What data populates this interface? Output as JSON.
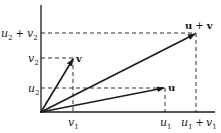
{
  "diagram": {
    "vectors": [
      {
        "name": "u",
        "label": "u",
        "x": 165,
        "y": 88
      },
      {
        "name": "v",
        "label": "v",
        "x": 74,
        "y": 58
      },
      {
        "name": "u+v",
        "label_a": "u",
        "label_plus": "+",
        "label_b": "v",
        "x": 196,
        "y": 33
      }
    ],
    "y_axis_labels": {
      "u2_plus_v2": {
        "a": "u",
        "a_sub": "2",
        "plus": "+",
        "b": "v",
        "b_sub": "2"
      },
      "v2": {
        "a": "v",
        "a_sub": "2"
      },
      "u2": {
        "a": "u",
        "a_sub": "2"
      }
    },
    "x_axis_labels": {
      "v1": {
        "a": "v",
        "a_sub": "1"
      },
      "u1": {
        "a": "u",
        "a_sub": "1"
      },
      "u1_plus_v1": {
        "a": "u",
        "a_sub": "1",
        "plus": "+",
        "b": "v",
        "b_sub": "1"
      }
    },
    "colors": {
      "ink": "#1a1a1a",
      "background": "#ffffff"
    }
  }
}
